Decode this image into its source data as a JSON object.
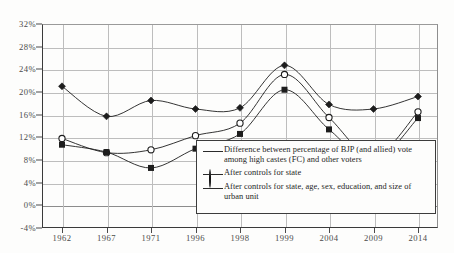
{
  "chart_data": {
    "type": "line",
    "title": "",
    "subtitle": "",
    "xlabel": "",
    "ylabel": "",
    "categories": [
      "1962",
      "1967",
      "1971",
      "1996",
      "1998",
      "1999",
      "2004",
      "2009",
      "2014"
    ],
    "ylim": [
      -4,
      32
    ],
    "ytick_labels": [
      "32%",
      "28%",
      "24%",
      "20%",
      "16%",
      "12%",
      "8%",
      "4%",
      "0%",
      "-4%"
    ],
    "ytick_values": [
      32,
      28,
      24,
      20,
      16,
      12,
      8,
      4,
      0,
      -4
    ],
    "grid": "both",
    "legend_position": "inside-bottom-right",
    "series": [
      {
        "name": "Difference between percentage of BJP (and allied) vote among high castes (FC) and other voters",
        "marker": "filled-diamond",
        "values": [
          21.0,
          15.7,
          18.5,
          17.0,
          17.2,
          24.7,
          17.8,
          17.0,
          19.2
        ]
      },
      {
        "name": "After controls for state",
        "marker": "open-circle",
        "values": [
          11.8,
          9.3,
          9.8,
          12.3,
          14.5,
          23.1,
          15.5,
          8.6,
          16.5
        ]
      },
      {
        "name": "After controls for state, age, sex, education, and size of urban unit",
        "marker": "filled-square",
        "values": [
          10.7,
          9.4,
          6.6,
          10.0,
          12.6,
          20.4,
          13.4,
          7.8,
          15.4
        ]
      }
    ]
  },
  "legend": {
    "items": [
      {
        "marker_name": "filled-diamond-marker",
        "label": "Difference between percentage of BJP (and allied) vote among high castes (FC) and other voters"
      },
      {
        "marker_name": "open-circle-marker",
        "label": "After controls for state"
      },
      {
        "marker_name": "filled-square-marker",
        "label": "After controls for state, age, sex, education, and size of urban unit"
      }
    ]
  },
  "colors": {
    "line": "#1d1d1d",
    "grid": "#bdbdbd",
    "axis": "#3a3a3a",
    "text": "#1d1d1d",
    "tick_text": "#4a4a4a",
    "background": "#fdfdfc"
  }
}
